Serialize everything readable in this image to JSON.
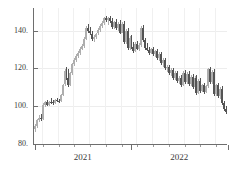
{
  "chart_data": {
    "type": "bar",
    "subtype": "candlestick-ohlc",
    "title": "",
    "subtitle": "",
    "xlabel": "",
    "ylabel": "",
    "grid": true,
    "legend": null,
    "xlim": [
      "2020-08",
      "2022-11"
    ],
    "ylim": [
      80,
      152
    ],
    "yticks": [
      80,
      100,
      120,
      140
    ],
    "ytick_labels": [
      "80.",
      "100.",
      "120.",
      "140."
    ],
    "xticks": [
      "2021",
      "2022"
    ],
    "xtick_labels": [
      "2021",
      "2022"
    ],
    "x_major_positions": [
      0.0,
      0.495,
      1.0
    ],
    "colors": {
      "up": "#aeaeae",
      "down": "#545454",
      "axis": "#6e6e6e",
      "grid": "#efefef",
      "background": "#ffffff",
      "text": "#3a3a3a"
    },
    "series": [
      {
        "name": "price",
        "candles": [
          {
            "o": 88.0,
            "h": 90.5,
            "l": 86.5,
            "c": 89.5,
            "dir": "up"
          },
          {
            "o": 89.5,
            "h": 93.0,
            "l": 88.5,
            "c": 92.5,
            "dir": "up"
          },
          {
            "o": 92.5,
            "h": 95.5,
            "l": 91.5,
            "c": 94.0,
            "dir": "up"
          },
          {
            "o": 94.0,
            "h": 96.0,
            "l": 92.0,
            "c": 93.0,
            "dir": "down"
          },
          {
            "o": 93.0,
            "h": 101.5,
            "l": 92.5,
            "c": 100.5,
            "dir": "up"
          },
          {
            "o": 100.5,
            "h": 103.0,
            "l": 99.5,
            "c": 102.0,
            "dir": "up"
          },
          {
            "o": 102.0,
            "h": 103.5,
            "l": 100.0,
            "c": 100.8,
            "dir": "down"
          },
          {
            "o": 100.8,
            "h": 103.0,
            "l": 100.0,
            "c": 102.5,
            "dir": "up"
          },
          {
            "o": 102.5,
            "h": 104.5,
            "l": 101.0,
            "c": 102.0,
            "dir": "down"
          },
          {
            "o": 102.0,
            "h": 103.5,
            "l": 100.5,
            "c": 101.5,
            "dir": "down"
          },
          {
            "o": 101.5,
            "h": 104.0,
            "l": 101.0,
            "c": 103.5,
            "dir": "up"
          },
          {
            "o": 103.5,
            "h": 104.5,
            "l": 102.0,
            "c": 103.0,
            "dir": "down"
          },
          {
            "o": 103.0,
            "h": 104.0,
            "l": 101.5,
            "c": 102.5,
            "dir": "down"
          },
          {
            "o": 102.5,
            "h": 106.5,
            "l": 102.0,
            "c": 106.0,
            "dir": "up"
          },
          {
            "o": 106.0,
            "h": 112.0,
            "l": 105.5,
            "c": 111.5,
            "dir": "up"
          },
          {
            "o": 111.5,
            "h": 119.5,
            "l": 110.5,
            "c": 118.5,
            "dir": "up"
          },
          {
            "o": 118.5,
            "h": 121.0,
            "l": 114.0,
            "c": 115.0,
            "dir": "down"
          },
          {
            "o": 115.0,
            "h": 119.5,
            "l": 110.0,
            "c": 111.0,
            "dir": "down"
          },
          {
            "o": 111.0,
            "h": 118.0,
            "l": 110.5,
            "c": 117.5,
            "dir": "up"
          },
          {
            "o": 117.5,
            "h": 123.0,
            "l": 116.5,
            "c": 122.5,
            "dir": "up"
          },
          {
            "o": 122.5,
            "h": 125.5,
            "l": 121.5,
            "c": 124.5,
            "dir": "up"
          },
          {
            "o": 124.5,
            "h": 127.5,
            "l": 123.5,
            "c": 126.5,
            "dir": "up"
          },
          {
            "o": 126.5,
            "h": 129.0,
            "l": 125.5,
            "c": 128.0,
            "dir": "up"
          },
          {
            "o": 128.0,
            "h": 131.5,
            "l": 127.0,
            "c": 130.5,
            "dir": "up"
          },
          {
            "o": 130.5,
            "h": 133.0,
            "l": 129.5,
            "c": 132.0,
            "dir": "up"
          },
          {
            "o": 132.0,
            "h": 136.5,
            "l": 131.0,
            "c": 135.5,
            "dir": "up"
          },
          {
            "o": 135.5,
            "h": 142.5,
            "l": 135.0,
            "c": 141.5,
            "dir": "up"
          },
          {
            "o": 141.5,
            "h": 143.5,
            "l": 139.0,
            "c": 140.0,
            "dir": "down"
          },
          {
            "o": 140.0,
            "h": 142.0,
            "l": 137.5,
            "c": 138.5,
            "dir": "down"
          },
          {
            "o": 138.5,
            "h": 140.0,
            "l": 134.5,
            "c": 135.5,
            "dir": "down"
          },
          {
            "o": 135.5,
            "h": 137.5,
            "l": 134.0,
            "c": 136.5,
            "dir": "up"
          },
          {
            "o": 136.5,
            "h": 139.0,
            "l": 135.5,
            "c": 138.5,
            "dir": "up"
          },
          {
            "o": 138.5,
            "h": 141.5,
            "l": 137.5,
            "c": 140.5,
            "dir": "up"
          },
          {
            "o": 140.5,
            "h": 143.5,
            "l": 139.5,
            "c": 142.5,
            "dir": "up"
          },
          {
            "o": 142.5,
            "h": 145.0,
            "l": 141.5,
            "c": 144.0,
            "dir": "up"
          },
          {
            "o": 144.0,
            "h": 147.5,
            "l": 143.0,
            "c": 146.5,
            "dir": "up"
          },
          {
            "o": 146.5,
            "h": 148.0,
            "l": 144.5,
            "c": 145.5,
            "dir": "down"
          },
          {
            "o": 145.5,
            "h": 147.5,
            "l": 143.0,
            "c": 146.5,
            "dir": "up"
          },
          {
            "o": 146.5,
            "h": 148.0,
            "l": 144.0,
            "c": 145.0,
            "dir": "down"
          },
          {
            "o": 145.0,
            "h": 146.5,
            "l": 141.0,
            "c": 142.0,
            "dir": "down"
          },
          {
            "o": 142.0,
            "h": 145.0,
            "l": 141.0,
            "c": 144.5,
            "dir": "up"
          },
          {
            "o": 144.5,
            "h": 146.0,
            "l": 140.5,
            "c": 141.5,
            "dir": "down"
          },
          {
            "o": 141.5,
            "h": 144.5,
            "l": 140.0,
            "c": 143.5,
            "dir": "up"
          },
          {
            "o": 143.5,
            "h": 145.5,
            "l": 138.0,
            "c": 139.0,
            "dir": "down"
          },
          {
            "o": 139.0,
            "h": 144.5,
            "l": 138.5,
            "c": 143.5,
            "dir": "up"
          },
          {
            "o": 143.5,
            "h": 145.0,
            "l": 133.0,
            "c": 134.0,
            "dir": "down"
          },
          {
            "o": 134.0,
            "h": 141.0,
            "l": 133.0,
            "c": 140.0,
            "dir": "up"
          },
          {
            "o": 140.0,
            "h": 141.5,
            "l": 130.0,
            "c": 131.0,
            "dir": "down"
          },
          {
            "o": 131.0,
            "h": 137.0,
            "l": 130.0,
            "c": 136.0,
            "dir": "up"
          },
          {
            "o": 136.0,
            "h": 137.5,
            "l": 130.5,
            "c": 131.5,
            "dir": "down"
          },
          {
            "o": 131.5,
            "h": 134.0,
            "l": 128.0,
            "c": 129.0,
            "dir": "down"
          },
          {
            "o": 129.0,
            "h": 134.0,
            "l": 128.5,
            "c": 133.0,
            "dir": "up"
          },
          {
            "o": 133.0,
            "h": 134.5,
            "l": 129.5,
            "c": 130.5,
            "dir": "down"
          },
          {
            "o": 130.5,
            "h": 133.5,
            "l": 129.0,
            "c": 132.5,
            "dir": "up"
          },
          {
            "o": 132.5,
            "h": 142.5,
            "l": 131.5,
            "c": 141.5,
            "dir": "up"
          },
          {
            "o": 141.5,
            "h": 143.0,
            "l": 134.0,
            "c": 135.0,
            "dir": "down"
          },
          {
            "o": 135.0,
            "h": 136.0,
            "l": 130.0,
            "c": 131.0,
            "dir": "down"
          },
          {
            "o": 131.0,
            "h": 133.5,
            "l": 129.0,
            "c": 130.0,
            "dir": "down"
          },
          {
            "o": 130.0,
            "h": 131.5,
            "l": 127.0,
            "c": 128.0,
            "dir": "down"
          },
          {
            "o": 128.0,
            "h": 131.0,
            "l": 127.5,
            "c": 130.5,
            "dir": "up"
          },
          {
            "o": 130.5,
            "h": 131.5,
            "l": 126.5,
            "c": 127.5,
            "dir": "down"
          },
          {
            "o": 127.5,
            "h": 130.0,
            "l": 126.0,
            "c": 129.5,
            "dir": "up"
          },
          {
            "o": 129.5,
            "h": 130.5,
            "l": 124.5,
            "c": 125.5,
            "dir": "down"
          },
          {
            "o": 125.5,
            "h": 128.5,
            "l": 124.0,
            "c": 127.5,
            "dir": "up"
          },
          {
            "o": 127.5,
            "h": 128.5,
            "l": 122.0,
            "c": 123.0,
            "dir": "down"
          },
          {
            "o": 123.0,
            "h": 125.5,
            "l": 121.0,
            "c": 124.5,
            "dir": "up"
          },
          {
            "o": 124.5,
            "h": 125.5,
            "l": 119.0,
            "c": 120.0,
            "dir": "down"
          },
          {
            "o": 120.0,
            "h": 122.0,
            "l": 118.0,
            "c": 121.0,
            "dir": "up"
          },
          {
            "o": 121.0,
            "h": 122.0,
            "l": 116.5,
            "c": 117.5,
            "dir": "down"
          },
          {
            "o": 117.5,
            "h": 120.0,
            "l": 116.0,
            "c": 119.0,
            "dir": "up"
          },
          {
            "o": 119.0,
            "h": 120.0,
            "l": 114.0,
            "c": 115.0,
            "dir": "down"
          },
          {
            "o": 115.0,
            "h": 118.5,
            "l": 114.0,
            "c": 117.5,
            "dir": "up"
          },
          {
            "o": 117.5,
            "h": 118.5,
            "l": 112.5,
            "c": 113.5,
            "dir": "down"
          },
          {
            "o": 113.5,
            "h": 116.0,
            "l": 112.0,
            "c": 115.0,
            "dir": "up"
          },
          {
            "o": 115.0,
            "h": 116.5,
            "l": 110.0,
            "c": 111.0,
            "dir": "down"
          },
          {
            "o": 111.0,
            "h": 118.5,
            "l": 110.5,
            "c": 117.5,
            "dir": "up"
          },
          {
            "o": 117.5,
            "h": 119.0,
            "l": 112.0,
            "c": 113.0,
            "dir": "down"
          },
          {
            "o": 113.0,
            "h": 118.0,
            "l": 112.0,
            "c": 117.0,
            "dir": "up"
          },
          {
            "o": 117.0,
            "h": 118.5,
            "l": 110.5,
            "c": 111.5,
            "dir": "down"
          },
          {
            "o": 111.5,
            "h": 116.5,
            "l": 110.5,
            "c": 115.5,
            "dir": "up"
          },
          {
            "o": 115.5,
            "h": 117.0,
            "l": 109.0,
            "c": 110.0,
            "dir": "down"
          },
          {
            "o": 110.0,
            "h": 116.0,
            "l": 109.0,
            "c": 115.0,
            "dir": "up"
          },
          {
            "o": 115.0,
            "h": 116.5,
            "l": 106.0,
            "c": 107.0,
            "dir": "down"
          },
          {
            "o": 107.0,
            "h": 114.5,
            "l": 106.5,
            "c": 113.5,
            "dir": "up"
          },
          {
            "o": 113.5,
            "h": 115.0,
            "l": 107.0,
            "c": 108.0,
            "dir": "down"
          },
          {
            "o": 108.0,
            "h": 112.0,
            "l": 107.5,
            "c": 111.5,
            "dir": "up"
          },
          {
            "o": 111.5,
            "h": 112.5,
            "l": 106.5,
            "c": 107.5,
            "dir": "down"
          },
          {
            "o": 107.5,
            "h": 111.0,
            "l": 107.0,
            "c": 110.5,
            "dir": "up"
          },
          {
            "o": 110.5,
            "h": 120.5,
            "l": 109.5,
            "c": 119.5,
            "dir": "up"
          },
          {
            "o": 119.5,
            "h": 121.0,
            "l": 112.0,
            "c": 113.0,
            "dir": "down"
          },
          {
            "o": 113.0,
            "h": 119.0,
            "l": 112.0,
            "c": 118.0,
            "dir": "up"
          },
          {
            "o": 118.0,
            "h": 119.5,
            "l": 105.5,
            "c": 106.5,
            "dir": "down"
          },
          {
            "o": 106.5,
            "h": 112.0,
            "l": 105.5,
            "c": 111.0,
            "dir": "up"
          },
          {
            "o": 111.0,
            "h": 112.5,
            "l": 104.5,
            "c": 105.5,
            "dir": "down"
          },
          {
            "o": 105.5,
            "h": 110.0,
            "l": 104.0,
            "c": 109.0,
            "dir": "up"
          },
          {
            "o": 109.0,
            "h": 110.5,
            "l": 100.5,
            "c": 101.5,
            "dir": "down"
          },
          {
            "o": 101.5,
            "h": 103.0,
            "l": 97.5,
            "c": 98.5,
            "dir": "down"
          },
          {
            "o": 98.5,
            "h": 100.0,
            "l": 96.0,
            "c": 97.0,
            "dir": "down"
          }
        ]
      }
    ]
  }
}
